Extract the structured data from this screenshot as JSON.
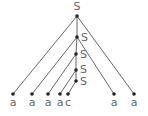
{
  "diagram": {
    "type": "parse-tree",
    "nodes": [
      {
        "id": "n0",
        "label": "S",
        "x": 77,
        "y": 16,
        "lx": 77,
        "ly": 10,
        "anchor": "middle"
      },
      {
        "id": "n1",
        "label": "S",
        "x": 77,
        "y": 37,
        "lx": 81,
        "ly": 41,
        "anchor": "start"
      },
      {
        "id": "n2",
        "label": "S",
        "x": 76,
        "y": 54,
        "lx": 80,
        "ly": 58,
        "anchor": "start"
      },
      {
        "id": "n3",
        "label": "S",
        "x": 76,
        "y": 70,
        "lx": 80,
        "ly": 73,
        "anchor": "start"
      },
      {
        "id": "n4",
        "label": "S",
        "x": 76,
        "y": 81,
        "lx": 80,
        "ly": 85,
        "anchor": "start"
      },
      {
        "id": "l0",
        "label": "a",
        "x": 13,
        "y": 94,
        "lx": 13,
        "ly": 106,
        "anchor": "middle"
      },
      {
        "id": "l1",
        "label": "a",
        "x": 32,
        "y": 94,
        "lx": 32,
        "ly": 106,
        "anchor": "middle"
      },
      {
        "id": "l2",
        "label": "a",
        "x": 48,
        "y": 94,
        "lx": 48,
        "ly": 106,
        "anchor": "middle"
      },
      {
        "id": "l3",
        "label": "a",
        "x": 60,
        "y": 94,
        "lx": 60,
        "ly": 106,
        "anchor": "middle"
      },
      {
        "id": "l4",
        "label": "c",
        "x": 68,
        "y": 94,
        "lx": 68,
        "ly": 106,
        "anchor": "middle"
      },
      {
        "id": "l5",
        "label": "a",
        "x": 114,
        "y": 94,
        "lx": 114,
        "ly": 106,
        "anchor": "middle"
      },
      {
        "id": "l6",
        "label": "a",
        "x": 134,
        "y": 94,
        "lx": 134,
        "ly": 106,
        "anchor": "middle"
      }
    ],
    "edges": [
      [
        "n0",
        "l0"
      ],
      [
        "n0",
        "n1"
      ],
      [
        "n0",
        "l6"
      ],
      [
        "n1",
        "l1"
      ],
      [
        "n1",
        "n2"
      ],
      [
        "n1",
        "l5"
      ],
      [
        "n2",
        "l2"
      ],
      [
        "n2",
        "n3"
      ],
      [
        "n3",
        "l3"
      ],
      [
        "n3",
        "n4"
      ],
      [
        "n4",
        "l4"
      ]
    ]
  }
}
